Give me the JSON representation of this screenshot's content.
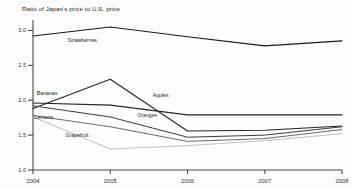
{
  "chart_data": {
    "type": "line",
    "title": "Ratio of Japan's price to U.S. price",
    "xlabel": "",
    "ylabel": "",
    "x": [
      2004,
      2005,
      2006,
      2007,
      2008
    ],
    "categories": [
      "2004",
      "2005",
      "2006",
      "2007",
      "2008"
    ],
    "xtick_labels": [
      "2004",
      "2005",
      "2006",
      "2007",
      "2008"
    ],
    "ytick_labels": [
      "3.0",
      "2.5",
      "2.0",
      "1.5",
      "1.0"
    ],
    "ytick_values": [
      3.0,
      2.5,
      2.0,
      1.5,
      1.0
    ],
    "ylim": [
      1.0,
      3.15
    ],
    "xlim": [
      2004,
      2008
    ],
    "grid": false,
    "legend": "inline-labels",
    "series": [
      {
        "name": "Strawberries",
        "label": "Strawberries",
        "color": "#1a1a1a",
        "width": 1.15,
        "values": [
          2.92,
          3.05,
          2.91,
          2.78,
          2.85
        ],
        "label_x": 2004.45,
        "label_y": 2.83
      },
      {
        "name": "Apples",
        "label": "Apples",
        "color": "#262626",
        "width": 1.1,
        "values": [
          1.88,
          2.3,
          1.56,
          1.57,
          1.63
        ],
        "label_x": 2005.55,
        "label_y": 2.04
      },
      {
        "name": "Bananas",
        "label": "Bananas",
        "color": "#262626",
        "width": 1.1,
        "values": [
          1.96,
          1.93,
          1.79,
          1.79,
          1.79
        ],
        "label_x": 2004.05,
        "label_y": 2.07
      },
      {
        "name": "Oranges",
        "label": "Oranges",
        "color": "#3a3a3a",
        "width": 1.0,
        "values": [
          1.92,
          1.76,
          1.47,
          1.5,
          1.62
        ],
        "label_x": 2005.35,
        "label_y": 1.76
      },
      {
        "name": "Lemons",
        "label": "Lemons",
        "color": "#5a5a5a",
        "width": 0.9,
        "values": [
          1.78,
          1.62,
          1.41,
          1.45,
          1.58
        ],
        "label_x": 2004.02,
        "label_y": 1.73
      },
      {
        "name": "Grapefruit",
        "label": "Grapefruit",
        "color": "#b8b8b8",
        "width": 0.9,
        "values": [
          1.76,
          1.3,
          1.35,
          1.42,
          1.52
        ],
        "label_x": 2004.42,
        "label_y": 1.48
      }
    ]
  }
}
